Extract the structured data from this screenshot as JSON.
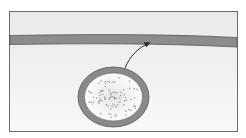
{
  "diagram": {
    "type": "cell-biology-illustration",
    "frame": {
      "x": 9,
      "y": 11,
      "width": 229,
      "height": 121,
      "stroke": "#6b6b6b"
    },
    "colors": {
      "background_top": "#ececec",
      "background_bottom": "#f7f7f7",
      "membrane_fill": "#8c8c8c",
      "membrane_stroke": "#5a5a5a",
      "vesicle_ring": "#8a8a8a",
      "vesicle_ring_stroke": "#555555",
      "vesicle_interior": "#f5f5f5",
      "particles": "#9a9a9a",
      "arrow": "#2a2a2a"
    },
    "elements": [
      {
        "id": "membrane",
        "label": "membrane band"
      },
      {
        "id": "vesicle",
        "label": "vesicle",
        "cx": 113.5,
        "cy": 97,
        "rx": 35.5,
        "ry": 30,
        "ring_width": 6
      },
      {
        "id": "arrow",
        "label": "movement arrow",
        "from": [
          125,
          68
        ],
        "to": [
          151,
          42
        ]
      }
    ],
    "text_labels": []
  }
}
